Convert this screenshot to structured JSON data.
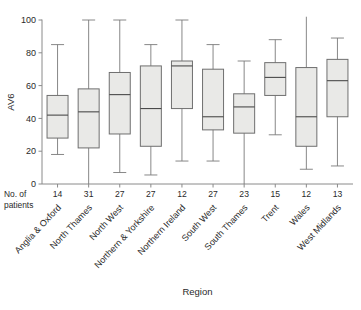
{
  "chart_data": {
    "type": "box",
    "title": "",
    "xlabel": "Region",
    "ylabel": "AV6",
    "ylim": [
      0,
      100
    ],
    "yticks": [
      0,
      20,
      40,
      60,
      80,
      100
    ],
    "grid": false,
    "legend": "none",
    "count_row_label_line1": "No. of",
    "count_row_label_line2": "patients",
    "categories": [
      "Anglia & Oxford",
      "North Thames",
      "North West",
      "Northern & Yorkshire",
      "Northern Ireland",
      "South West",
      "South Thames",
      "Trent",
      "Wales",
      "West Midlands"
    ],
    "counts": [
      14,
      31,
      27,
      27,
      27,
      12,
      27,
      23,
      15,
      12,
      13
    ],
    "counts_shown": [
      14,
      31,
      27,
      27,
      12,
      27,
      23,
      15,
      12,
      13
    ],
    "boxes": [
      {
        "category": "Anglia & Oxford",
        "n": 14,
        "whisker_low": 18,
        "q1": 28,
        "median": 42,
        "q3": 54,
        "whisker_high": 85
      },
      {
        "category": "North Thames",
        "n": 31,
        "whisker_low": 0,
        "q1": 22,
        "median": 44,
        "q3": 58,
        "whisker_high": 100
      },
      {
        "category": "North West",
        "n": 27,
        "whisker_low": 7,
        "q1": 30.5,
        "median": 54.5,
        "q3": 68,
        "whisker_high": 100
      },
      {
        "category": "Northern & Yorkshire",
        "n": 27,
        "whisker_low": 5.5,
        "q1": 23,
        "median": 46,
        "q3": 72,
        "whisker_high": 85
      },
      {
        "category": "Northern Ireland",
        "n": 12,
        "whisker_low": 14,
        "q1": 46,
        "median": 72,
        "q3": 75,
        "whisker_high": 100
      },
      {
        "category": "South West",
        "n": 27,
        "whisker_low": 14,
        "q1": 33,
        "median": 41,
        "q3": 70,
        "whisker_high": 85
      },
      {
        "category": "South Thames",
        "n": 23,
        "whisker_low": 0,
        "q1": 31,
        "median": 47,
        "q3": 55,
        "whisker_high": 75
      },
      {
        "category": "Trent",
        "n": 15,
        "whisker_low": 30,
        "q1": 54,
        "median": 65,
        "q3": 74,
        "whisker_high": 88
      },
      {
        "category": "Wales",
        "n": 12,
        "whisker_low": 9,
        "q1": 23,
        "median": 41,
        "q3": 71,
        "whisker_high": 102
      },
      {
        "category": "West Midlands",
        "n": 13,
        "whisker_low": 11,
        "q1": 41,
        "median": 63,
        "q3": 76,
        "whisker_high": 89
      }
    ]
  },
  "colors": {
    "box_fill": "#e9e9e7",
    "box_stroke": "#6f6f6f",
    "axis": "#8a8a8a",
    "text": "#2a2a2a",
    "background": "#ffffff"
  }
}
